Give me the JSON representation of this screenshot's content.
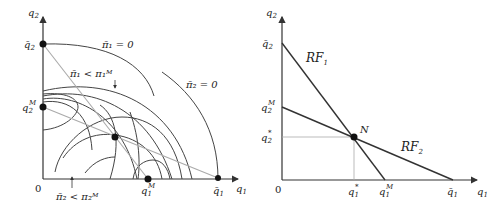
{
  "left_panel": {
    "axis_labels": {
      "x": "q",
      "x_sub": "1",
      "y": "q",
      "y_sub": "2"
    },
    "origin_label": "0",
    "y_ticks": [
      {
        "base": "q̄",
        "sub": "2",
        "sup": ""
      },
      {
        "base": "q",
        "sub": "2",
        "sup": "M"
      }
    ],
    "x_ticks": [
      {
        "base": "q",
        "sub": "1",
        "sup": "M"
      },
      {
        "base": "q̄",
        "sub": "1",
        "sup": ""
      }
    ],
    "annotations": {
      "pi1_zero": "π̄₁ = 0",
      "pi2_zero": "π̄₂ = 0",
      "pi1_less": "π̄₁ < π₁ᴹ",
      "pi2_less": "π̄₂ < π₂ᴹ"
    }
  },
  "right_panel": {
    "axis_labels": {
      "x": "q",
      "x_sub": "1",
      "y": "q",
      "y_sub": "2"
    },
    "origin_label": "0",
    "y_ticks": [
      {
        "base": "q̄",
        "sub": "2",
        "sup": ""
      },
      {
        "base": "q",
        "sub": "2",
        "sup": "M"
      },
      {
        "base": "q",
        "sub": "2",
        "sup": "*"
      }
    ],
    "x_ticks": [
      {
        "base": "q",
        "sub": "1",
        "sup": "*"
      },
      {
        "base": "q",
        "sub": "1",
        "sup": "M"
      },
      {
        "base": "q̄",
        "sub": "1",
        "sup": ""
      }
    ],
    "curve_labels": {
      "rf1": "RF",
      "rf1_sub": "1",
      "rf2": "RF",
      "rf2_sub": "2"
    },
    "equilibrium_label": "N"
  }
}
